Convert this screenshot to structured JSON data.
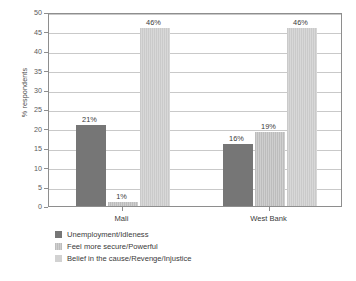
{
  "chart_data": {
    "type": "bar",
    "title": "",
    "xlabel": "",
    "ylabel": "% respondents",
    "categories": [
      "Mali",
      "West Bank"
    ],
    "ylim": [
      0,
      50
    ],
    "yticks": [
      0,
      5,
      10,
      15,
      20,
      25,
      30,
      35,
      40,
      45,
      50
    ],
    "ytick_labels": [
      "0",
      "5",
      "10",
      "15",
      "20",
      "25",
      "30",
      "35",
      "40",
      "45",
      "50"
    ],
    "grid": true,
    "legend_position": "below-left",
    "series": [
      {
        "name": "Unemployment/Idleness",
        "color": "#767676",
        "values": [
          21,
          16
        ],
        "labels": [
          "21%",
          "16%"
        ]
      },
      {
        "name": "Feel more secure/Powerful",
        "color": "#c6c6c6",
        "values": [
          1,
          19
        ],
        "labels": [
          "1%",
          "19%"
        ]
      },
      {
        "name": "Belief in the cause/Revenge/Injustice",
        "color": "#d2d2d2",
        "values": [
          46,
          46
        ],
        "labels": [
          "46%",
          "46%"
        ]
      }
    ]
  },
  "axis": {
    "y_title": "% respondents"
  },
  "colors": {
    "series_0": "#767676",
    "series_1": "#c6c6c6",
    "series_2": "#d2d2d2",
    "axis_line": "#8e8e8e",
    "gridline": "#c9c9c9",
    "text": "#3a3a3a",
    "background": "#ffffff"
  }
}
